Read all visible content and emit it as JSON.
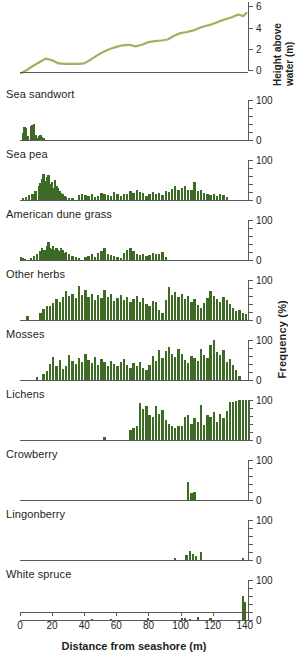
{
  "figure": {
    "x_axis": {
      "title": "Distance from seashore (m)",
      "ticks": [
        0,
        20,
        40,
        60,
        80,
        100,
        120,
        140
      ],
      "min": 0,
      "max": 142
    },
    "frequency_axis_title": "Frequency (%)",
    "height_axis_title": "Height above water (m)",
    "bar_color": "#3d6b25",
    "line_color": "#a8ad5a",
    "axis_color": "#58595b"
  },
  "chart_data": [
    {
      "type": "line",
      "title": "Height above water",
      "ylabel": "Height above water (m)",
      "xlabel": "Distance from seashore (m)",
      "yticks": [
        0,
        2,
        4,
        6
      ],
      "ylim": [
        0,
        6.4
      ],
      "xlim": [
        0,
        142
      ],
      "grid": false,
      "x": [
        0,
        4,
        8,
        12,
        16,
        20,
        24,
        28,
        32,
        36,
        40,
        44,
        48,
        52,
        56,
        60,
        64,
        68,
        72,
        76,
        80,
        84,
        88,
        92,
        96,
        100,
        104,
        108,
        112,
        116,
        120,
        124,
        128,
        132,
        136,
        139,
        141
      ],
      "values": [
        0.0,
        0.35,
        0.75,
        1.1,
        1.45,
        1.3,
        1.0,
        0.95,
        0.95,
        0.95,
        1.0,
        1.35,
        1.75,
        2.1,
        2.35,
        2.55,
        2.7,
        2.75,
        2.6,
        2.75,
        3.0,
        3.1,
        3.15,
        3.25,
        3.6,
        3.85,
        3.95,
        4.1,
        4.35,
        4.55,
        4.7,
        4.95,
        5.15,
        5.35,
        5.6,
        5.45,
        5.75
      ]
    },
    {
      "type": "bar",
      "title": "Sea sandwort",
      "ylabel": "Frequency (%)",
      "xlabel": "Distance from seashore (m)",
      "yticks": [
        0,
        100
      ],
      "ylim": [
        0,
        100
      ],
      "xlim": [
        0,
        142
      ],
      "x": [
        1,
        2,
        3,
        4,
        5,
        6,
        7,
        8,
        9,
        10,
        11,
        12,
        13,
        14
      ],
      "values": [
        18,
        32,
        30,
        10,
        0,
        34,
        38,
        40,
        12,
        6,
        10,
        12,
        8,
        4
      ]
    },
    {
      "type": "bar",
      "title": "Sea pea",
      "ylabel": "Frequency (%)",
      "xlabel": "Distance from seashore (m)",
      "yticks": [
        0,
        100
      ],
      "ylim": [
        0,
        100
      ],
      "xlim": [
        0,
        142
      ],
      "x": [
        1,
        3,
        5,
        7,
        9,
        11,
        12,
        13,
        14,
        15,
        16,
        17,
        18,
        19,
        20,
        21,
        22,
        23,
        24,
        25,
        26,
        27,
        28,
        30,
        32,
        34,
        36,
        38,
        40,
        42,
        44,
        46,
        48,
        50,
        52,
        54,
        56,
        58,
        60,
        62,
        64,
        66,
        68,
        70,
        72,
        74,
        76,
        78,
        80,
        82,
        84,
        86,
        88,
        90,
        92,
        94,
        96,
        98,
        100,
        102,
        104,
        106,
        108,
        110,
        112,
        114,
        116,
        118,
        120,
        122,
        124,
        126,
        128
      ],
      "values": [
        6,
        8,
        12,
        16,
        22,
        34,
        42,
        52,
        66,
        48,
        58,
        62,
        40,
        44,
        30,
        50,
        36,
        30,
        22,
        18,
        16,
        10,
        8,
        6,
        4,
        0,
        12,
        14,
        12,
        10,
        14,
        8,
        10,
        18,
        16,
        12,
        10,
        20,
        14,
        10,
        16,
        14,
        22,
        18,
        26,
        20,
        18,
        10,
        14,
        20,
        16,
        18,
        12,
        22,
        20,
        28,
        34,
        26,
        30,
        36,
        24,
        26,
        44,
        22,
        26,
        18,
        14,
        12,
        16,
        10,
        14,
        12,
        8
      ]
    },
    {
      "type": "bar",
      "title": "American dune grass",
      "ylabel": "Frequency (%)",
      "xlabel": "Distance from seashore (m)",
      "yticks": [
        0,
        100
      ],
      "ylim": [
        0,
        100
      ],
      "xlim": [
        0,
        142
      ],
      "x": [
        0,
        1,
        2,
        4,
        6,
        8,
        10,
        12,
        13,
        14,
        15,
        16,
        17,
        18,
        19,
        20,
        21,
        22,
        23,
        24,
        25,
        26,
        27,
        28,
        30,
        32,
        34,
        36,
        38,
        40,
        42,
        44,
        46,
        48,
        50,
        52,
        54,
        56,
        58,
        60,
        62,
        64,
        66,
        68,
        70,
        72,
        74,
        76,
        78,
        80,
        82,
        84,
        86,
        88,
        90
      ],
      "values": [
        8,
        4,
        2,
        0,
        6,
        10,
        16,
        22,
        30,
        24,
        26,
        34,
        46,
        30,
        28,
        36,
        24,
        30,
        26,
        22,
        30,
        24,
        18,
        20,
        14,
        10,
        8,
        6,
        0,
        8,
        10,
        14,
        8,
        18,
        22,
        30,
        16,
        12,
        10,
        8,
        6,
        18,
        26,
        30,
        22,
        14,
        12,
        16,
        10,
        12,
        18,
        14,
        16,
        20,
        8
      ]
    },
    {
      "type": "bar",
      "title": "Other herbs",
      "ylabel": "Frequency (%)",
      "xlabel": "Distance from seashore (m)",
      "yticks": [
        0,
        100
      ],
      "ylim": [
        0,
        100
      ],
      "xlim": [
        0,
        142
      ],
      "x": [
        4,
        12,
        14,
        16,
        18,
        20,
        22,
        24,
        26,
        28,
        30,
        32,
        34,
        36,
        38,
        40,
        42,
        44,
        46,
        48,
        50,
        52,
        54,
        56,
        58,
        60,
        62,
        64,
        66,
        68,
        70,
        72,
        74,
        76,
        78,
        80,
        82,
        84,
        86,
        88,
        90,
        92,
        94,
        96,
        98,
        100,
        102,
        104,
        106,
        108,
        110,
        112,
        114,
        116,
        118,
        120,
        122,
        124,
        126,
        128,
        130,
        132,
        134,
        136,
        138,
        140
      ],
      "values": [
        10,
        18,
        28,
        36,
        34,
        42,
        52,
        46,
        58,
        72,
        60,
        66,
        54,
        86,
        62,
        74,
        58,
        66,
        50,
        62,
        56,
        74,
        58,
        66,
        48,
        56,
        62,
        50,
        58,
        44,
        52,
        60,
        46,
        54,
        40,
        34,
        48,
        44,
        26,
        18,
        50,
        82,
        62,
        70,
        58,
        66,
        52,
        60,
        44,
        52,
        38,
        30,
        42,
        56,
        72,
        60,
        52,
        46,
        58,
        50,
        40,
        30,
        22,
        26,
        18,
        14
      ]
    },
    {
      "type": "bar",
      "title": "Mosses",
      "ylabel": "Frequency (%)",
      "xlabel": "Distance from seashore (m)",
      "yticks": [
        0,
        100
      ],
      "ylim": [
        0,
        100
      ],
      "xlim": [
        0,
        142
      ],
      "x": [
        10,
        14,
        16,
        18,
        20,
        22,
        24,
        26,
        28,
        30,
        32,
        34,
        36,
        38,
        40,
        42,
        44,
        46,
        48,
        50,
        52,
        54,
        56,
        58,
        60,
        62,
        64,
        66,
        68,
        70,
        72,
        74,
        76,
        78,
        80,
        82,
        84,
        86,
        88,
        90,
        92,
        94,
        96,
        98,
        100,
        102,
        104,
        106,
        108,
        110,
        112,
        114,
        116,
        118,
        120,
        122,
        124,
        126,
        128,
        130,
        132,
        134,
        136
      ],
      "values": [
        8,
        14,
        22,
        40,
        58,
        36,
        50,
        28,
        34,
        62,
        48,
        40,
        56,
        44,
        66,
        50,
        42,
        58,
        38,
        52,
        44,
        36,
        48,
        40,
        34,
        44,
        52,
        38,
        30,
        42,
        36,
        44,
        30,
        26,
        38,
        60,
        48,
        76,
        54,
        72,
        82,
        66,
        58,
        78,
        64,
        50,
        42,
        60,
        56,
        48,
        78,
        62,
        54,
        88,
        100,
        70,
        62,
        74,
        46,
        52,
        38,
        24,
        10
      ]
    },
    {
      "type": "bar",
      "title": "Lichens",
      "ylabel": "Frequency (%)",
      "xlabel": "Distance from seashore (m)",
      "yticks": [
        0,
        100
      ],
      "ylim": [
        0,
        100
      ],
      "xlim": [
        0,
        142
      ],
      "x": [
        52,
        68,
        70,
        72,
        74,
        76,
        78,
        80,
        82,
        84,
        86,
        88,
        90,
        92,
        94,
        96,
        98,
        100,
        102,
        104,
        106,
        108,
        110,
        112,
        114,
        116,
        118,
        120,
        122,
        124,
        126,
        128,
        130,
        132,
        134,
        136,
        138,
        140,
        142
      ],
      "values": [
        8,
        26,
        30,
        34,
        92,
        78,
        86,
        62,
        58,
        86,
        66,
        74,
        50,
        40,
        34,
        30,
        36,
        34,
        58,
        62,
        40,
        56,
        44,
        88,
        38,
        62,
        58,
        70,
        44,
        66,
        56,
        72,
        94,
        96,
        98,
        100,
        100,
        100,
        100
      ]
    },
    {
      "type": "bar",
      "title": "Crowberry",
      "ylabel": "Frequency (%)",
      "xlabel": "Distance from seashore (m)",
      "yticks": [
        0,
        100
      ],
      "ylim": [
        0,
        100
      ],
      "xlim": [
        0,
        142
      ],
      "x": [
        104,
        106,
        108
      ],
      "values": [
        44,
        18,
        20
      ]
    },
    {
      "type": "bar",
      "title": "Lingonberry",
      "ylabel": "Frequency (%)",
      "xlabel": "Distance from seashore (m)",
      "yticks": [
        0,
        100
      ],
      "ylim": [
        0,
        100
      ],
      "xlim": [
        0,
        142
      ],
      "x": [
        96,
        103,
        105,
        107,
        109,
        112,
        138
      ],
      "values": [
        4,
        12,
        22,
        16,
        10,
        20,
        6
      ]
    },
    {
      "type": "bar",
      "title": "White spruce",
      "ylabel": "Frequency (%)",
      "xlabel": "Distance from seashore (m)",
      "yticks": [
        0,
        100
      ],
      "ylim": [
        0,
        100
      ],
      "xlim": [
        0,
        142
      ],
      "x": [
        44,
        56,
        79,
        100,
        102,
        105,
        110,
        118,
        138,
        139
      ],
      "values": [
        2,
        2,
        6,
        6,
        4,
        3,
        7,
        6,
        60,
        46
      ]
    }
  ]
}
